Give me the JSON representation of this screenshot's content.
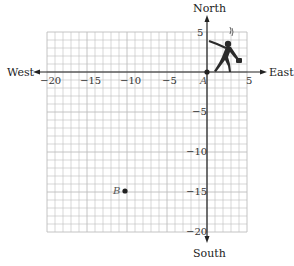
{
  "diagram": {
    "type": "coordinate-grid-map",
    "directions": {
      "north": "North",
      "south": "South",
      "east": "East",
      "west": "West"
    },
    "x_ticks": [
      {
        "value": -20,
        "label": "−20"
      },
      {
        "value": -15,
        "label": "−15"
      },
      {
        "value": -10,
        "label": "−10"
      },
      {
        "value": -5,
        "label": "−5"
      },
      {
        "value": 5,
        "label": "5"
      }
    ],
    "y_ticks": [
      {
        "value": 5,
        "label": "5"
      },
      {
        "value": -5,
        "label": "−5"
      },
      {
        "value": -10,
        "label": "−10"
      },
      {
        "value": -15,
        "label": "−15"
      },
      {
        "value": -20,
        "label": "−20"
      }
    ],
    "grid": {
      "xmin": -20,
      "xmax": 5,
      "ymin": -20,
      "ymax": 5,
      "step": 1
    },
    "points": [
      {
        "name": "A",
        "x": 0,
        "y": 0
      },
      {
        "name": "B",
        "x": -10,
        "y": -15
      }
    ],
    "figure": "walking-person-icon at origin heading toward point",
    "colors": {
      "grid": "#bdbdbd",
      "axis": "#222222",
      "point": "#222222",
      "figure": "#2a2a2a"
    }
  }
}
